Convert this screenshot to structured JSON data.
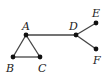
{
  "diagram": {
    "type": "undirected-graph",
    "nodes": [
      {
        "id": "A",
        "label": "A",
        "x": 26,
        "y": 35,
        "lx": 22,
        "ly": 30
      },
      {
        "id": "B",
        "label": "B",
        "x": 13,
        "y": 57,
        "lx": 6,
        "ly": 72
      },
      {
        "id": "C",
        "label": "C",
        "x": 40,
        "y": 57,
        "lx": 38,
        "ly": 72
      },
      {
        "id": "D",
        "label": "D",
        "x": 76,
        "y": 35,
        "lx": 69,
        "ly": 30
      },
      {
        "id": "E",
        "label": "E",
        "x": 96,
        "y": 23,
        "lx": 92,
        "ly": 17
      },
      {
        "id": "F",
        "label": "F",
        "x": 96,
        "y": 49,
        "lx": 93,
        "ly": 64
      }
    ],
    "edges": [
      {
        "from": "A",
        "to": "B"
      },
      {
        "from": "A",
        "to": "C"
      },
      {
        "from": "B",
        "to": "C"
      },
      {
        "from": "A",
        "to": "D"
      },
      {
        "from": "D",
        "to": "E"
      },
      {
        "from": "D",
        "to": "F"
      }
    ],
    "colors": {
      "edge": "#444444",
      "node": "#111111",
      "label": "#222222",
      "background": "#ffffff"
    }
  }
}
